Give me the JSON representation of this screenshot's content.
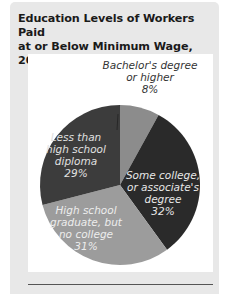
{
  "chart_data": {
    "type": "pie",
    "title": "Education Levels of Workers Paid at or Below Minimum Wage, 2009",
    "title_lines": [
      "Education Levels of Workers Paid",
      "at or Below Minimum Wage, 2009"
    ],
    "slices": [
      {
        "label": "Bachelor's degree or higher",
        "lines": [
          "Bachelor's degree",
          "or higher",
          "8%"
        ],
        "value": 8,
        "color": "#8c8c8c"
      },
      {
        "label": "Some college, or associate's degree",
        "lines": [
          "Some college,",
          "or associate's",
          "degree",
          "32%"
        ],
        "value": 32,
        "color": "#2a2a2a"
      },
      {
        "label": "High school graduate, but no college",
        "lines": [
          "High school",
          "graduate, but",
          "no college",
          "31%"
        ],
        "value": 31,
        "color": "#9c9c9c"
      },
      {
        "label": "Less than high school diploma",
        "lines": [
          "Less than",
          "high school",
          "diploma",
          "29%"
        ],
        "value": 29,
        "color": "#3c3c3c"
      }
    ],
    "values": [
      8,
      32,
      31,
      29
    ],
    "categories": [
      "Bachelor's degree or higher",
      "Some college, or associate's degree",
      "High school graduate, but no college",
      "Less than high school diploma"
    ],
    "unit": "%"
  }
}
